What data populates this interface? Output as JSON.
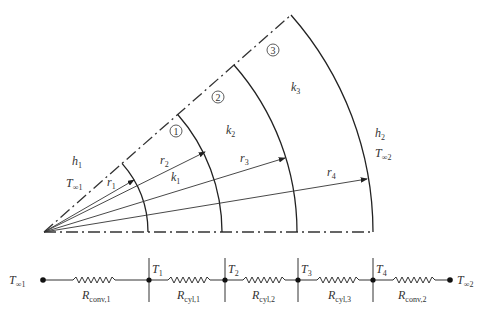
{
  "diagram": {
    "origin": [
      44,
      232
    ],
    "sector_angle_deg": 41.3,
    "colors": {
      "line": "#333333",
      "background": "#ffffff"
    },
    "layers": [
      {
        "id": "1",
        "marker": "1",
        "conductivity": "k",
        "conductivity_sub": "1"
      },
      {
        "id": "2",
        "marker": "2",
        "conductivity": "k",
        "conductivity_sub": "2"
      },
      {
        "id": "3",
        "marker": "3",
        "conductivity": "k",
        "conductivity_sub": "3"
      }
    ],
    "radii": [
      {
        "label": "r",
        "sub": "1"
      },
      {
        "label": "r",
        "sub": "2"
      },
      {
        "label": "r",
        "sub": "3"
      },
      {
        "label": "r",
        "sub": "4"
      }
    ],
    "inner_side": {
      "h": "h",
      "h_sub": "1",
      "T": "T",
      "T_sub": "∞1"
    },
    "outer_side": {
      "h": "h",
      "h_sub": "2",
      "T": "T",
      "T_sub": "∞2"
    }
  },
  "circuit": {
    "nodes": [
      {
        "label": "T",
        "sub": "∞1"
      },
      {
        "label": "T",
        "sub": "1"
      },
      {
        "label": "T",
        "sub": "2"
      },
      {
        "label": "T",
        "sub": "3"
      },
      {
        "label": "T",
        "sub": "4"
      },
      {
        "label": "T",
        "sub": "∞2"
      }
    ],
    "resistors": [
      {
        "label": "R",
        "sub": "conv,1"
      },
      {
        "label": "R",
        "sub": "cyl,1"
      },
      {
        "label": "R",
        "sub": "cyl,2"
      },
      {
        "label": "R",
        "sub": "cyl,3"
      },
      {
        "label": "R",
        "sub": "conv,2"
      }
    ]
  }
}
